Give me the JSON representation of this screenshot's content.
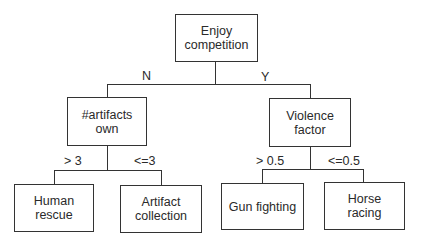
{
  "diagram": {
    "type": "decision-tree",
    "root": {
      "label": "Enjoy\ncompetition",
      "line1": "Enjoy",
      "line2": "competition"
    },
    "branches": {
      "no_label": "N",
      "yes_label": "Y"
    },
    "left_node": {
      "line1": "#artifacts",
      "line2": "own",
      "branch_gt": "> 3",
      "branch_le": "<=3"
    },
    "right_node": {
      "line1": "Violence",
      "line2": "factor",
      "branch_gt": "> 0.5",
      "branch_le": "<=0.5"
    },
    "leaves": [
      {
        "line1": "Human",
        "line2": "rescue"
      },
      {
        "line1": "Artifact",
        "line2": "collection"
      },
      {
        "line1": "Gun fighting",
        "line2": ""
      },
      {
        "line1": "Horse",
        "line2": "racing"
      }
    ]
  }
}
